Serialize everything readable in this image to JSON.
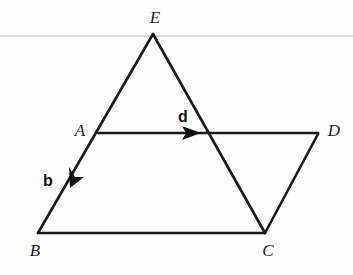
{
  "figure": {
    "width": 353,
    "height": 275,
    "background_color": "#fdfdfd",
    "stroke_color": "#1a1a1a",
    "rule_color": "#b9b9b9",
    "rule": {
      "name": "horizontal-rule",
      "y": 36,
      "x1": 0,
      "x2": 353,
      "thickness": 1.2
    },
    "points": [
      {
        "id": "E",
        "label": "E",
        "x": 153,
        "y": 34,
        "label_x": 155,
        "label_y": 17
      },
      {
        "id": "A",
        "label": "A",
        "x": 98,
        "y": 133,
        "label_x": 80,
        "label_y": 130
      },
      {
        "id": "D",
        "label": "D",
        "x": 318,
        "y": 134,
        "label_x": 334,
        "label_y": 130
      },
      {
        "id": "B",
        "label": "B",
        "x": 38,
        "y": 233,
        "label_x": 35,
        "label_y": 250
      },
      {
        "id": "C",
        "label": "C",
        "x": 265,
        "y": 233,
        "label_x": 268,
        "label_y": 250
      }
    ],
    "segments": [
      {
        "id": "EB",
        "name": "segment-e-b",
        "from": "E",
        "to": "B",
        "x1": 153,
        "y1": 34,
        "x2": 38,
        "y2": 233
      },
      {
        "id": "EC",
        "name": "segment-e-c",
        "from": "E",
        "to": "C",
        "x1": 153,
        "y1": 34,
        "x2": 265,
        "y2": 233
      },
      {
        "id": "BC",
        "name": "segment-b-c",
        "from": "B",
        "to": "C",
        "x1": 38,
        "y1": 233,
        "x2": 265,
        "y2": 233
      },
      {
        "id": "CD",
        "name": "segment-c-d",
        "from": "C",
        "to": "D",
        "x1": 265,
        "y1": 233,
        "x2": 318,
        "y2": 134
      },
      {
        "id": "AD",
        "name": "segment-a-d",
        "from": "A",
        "to": "D",
        "x1": 98,
        "y1": 133,
        "x2": 318,
        "y2": 133
      }
    ],
    "vectors": [
      {
        "id": "d",
        "label": "d",
        "name": "vector-d",
        "along": "A-to-D",
        "x1": 98,
        "y1": 133,
        "tip_x": 201,
        "tip_y": 133,
        "label_x": 183,
        "label_y": 117
      },
      {
        "id": "b",
        "label": "b",
        "name": "vector-b",
        "along": "A-to-B",
        "x1": 98,
        "y1": 133,
        "tip_x": 70,
        "tip_y": 182,
        "label_x": 48,
        "label_y": 181
      }
    ],
    "stroke_width": 2.6
  }
}
